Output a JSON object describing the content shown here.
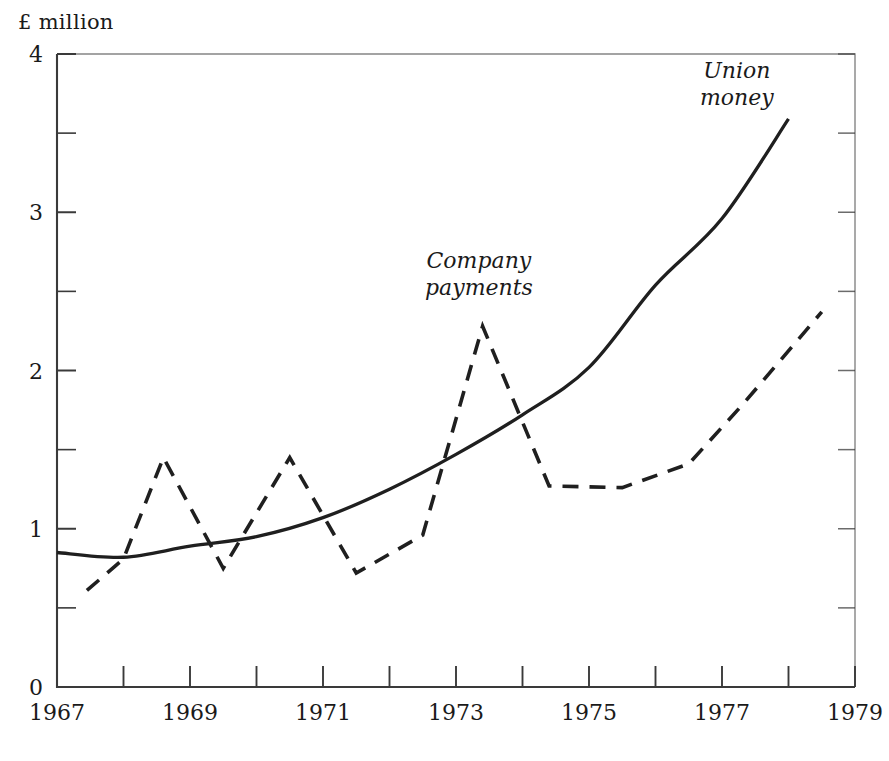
{
  "axis_unit_label": "£ million",
  "annotations": {
    "union_money": [
      "Union",
      "money"
    ],
    "company_payments": [
      "Company",
      "payments"
    ]
  },
  "y_tick_labels": [
    "0",
    "1",
    "2",
    "3",
    "4"
  ],
  "x_tick_labels": [
    "1967",
    "1969",
    "1971",
    "1973",
    "1975",
    "1977",
    "1979"
  ],
  "colors": {
    "axis": "#3a3a3a",
    "line": "#1f1f1f",
    "background": "#ffffff"
  },
  "chart_data": {
    "type": "line",
    "title": "",
    "subtitle": "",
    "xlabel": "",
    "ylabel": "£ million",
    "xlim": [
      1967,
      1979
    ],
    "ylim": [
      0,
      4
    ],
    "grid": false,
    "legend_position": "inline-annotations",
    "y_major_ticks": [
      0,
      1,
      2,
      3,
      4
    ],
    "y_minor_ticks": [
      0.5,
      1.5,
      2.5,
      3.5
    ],
    "x_major_ticks": [
      1967,
      1969,
      1971,
      1973,
      1975,
      1977,
      1979
    ],
    "x_minor_ticks": [
      1968,
      1970,
      1972,
      1974,
      1976,
      1978
    ],
    "series": [
      {
        "name": "Union money",
        "style": "solid",
        "x": [
          1967.0,
          1968.0,
          1969.0,
          1970.0,
          1971.0,
          1972.0,
          1973.0,
          1974.0,
          1975.0,
          1976.0,
          1977.0,
          1978.0
        ],
        "values": [
          0.85,
          0.82,
          0.89,
          0.95,
          1.07,
          1.25,
          1.47,
          1.72,
          2.02,
          2.54,
          2.96,
          3.59
        ]
      },
      {
        "name": "Company payments",
        "style": "dashed",
        "x": [
          1967.45,
          1968.0,
          1968.6,
          1969.5,
          1970.5,
          1971.5,
          1972.5,
          1973.4,
          1974.4,
          1975.5,
          1976.5,
          1977.3,
          1978.5
        ],
        "values": [
          0.61,
          0.81,
          1.45,
          0.75,
          1.45,
          0.72,
          0.96,
          2.28,
          1.27,
          1.26,
          1.41,
          1.78,
          2.37
        ]
      }
    ]
  }
}
